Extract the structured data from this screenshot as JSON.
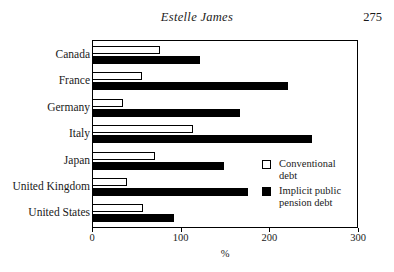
{
  "header": {
    "title": "Estelle James",
    "page_number": "275"
  },
  "legend": {
    "position": "inside-right",
    "items": [
      {
        "label": "Conventional debt",
        "swatch": "open-square-icon",
        "color": "#ffffff"
      },
      {
        "label": "Implicit public pension debt",
        "swatch": "filled-square-icon",
        "color": "#000000"
      }
    ]
  },
  "axis": {
    "x_title": "%",
    "x_ticks": [
      "0",
      "100",
      "200",
      "300"
    ]
  },
  "chart_data": {
    "type": "bar",
    "orientation": "horizontal",
    "title": "",
    "xlabel": "%",
    "ylabel": "",
    "xlim": [
      0,
      300
    ],
    "grid": false,
    "legend_position": "inside-right",
    "categories": [
      "Canada",
      "France",
      "Germany",
      "Italy",
      "Japan",
      "United Kingdom",
      "United States"
    ],
    "series": [
      {
        "name": "Conventional debt",
        "color": "#ffffff",
        "values": [
          77,
          56,
          35,
          114,
          71,
          39,
          57
        ]
      },
      {
        "name": "Implicit public pension debt",
        "color": "#000000",
        "values": [
          122,
          221,
          167,
          248,
          149,
          176,
          93
        ]
      }
    ]
  }
}
